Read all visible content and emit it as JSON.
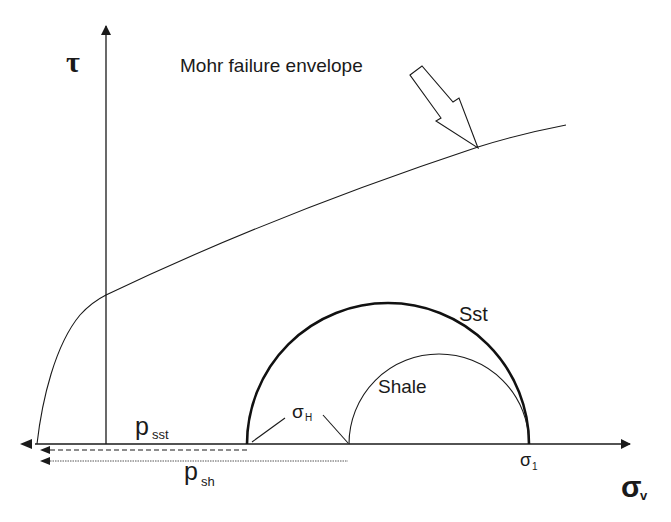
{
  "diagram": {
    "axes": {
      "y_label": "τ",
      "x_label_main": "σ",
      "x_label_sub": "v"
    },
    "envelope": {
      "label": "Mohr failure envelope"
    },
    "circles": [
      {
        "name": "Sst",
        "label": "Sst",
        "style": "thick"
      },
      {
        "name": "Shale",
        "label": "Shale",
        "style": "thin"
      }
    ],
    "annotations": {
      "sigma_h_main": "σ",
      "sigma_h_sub": "H",
      "sigma_1_main": "σ",
      "sigma_1_sub": "1",
      "p_sst_main": "p",
      "p_sst_sub": "sst",
      "p_sh_main": "p",
      "p_sh_sub": "sh"
    },
    "colors": {
      "stroke": "#1a1a1a",
      "background": "#ffffff"
    }
  }
}
